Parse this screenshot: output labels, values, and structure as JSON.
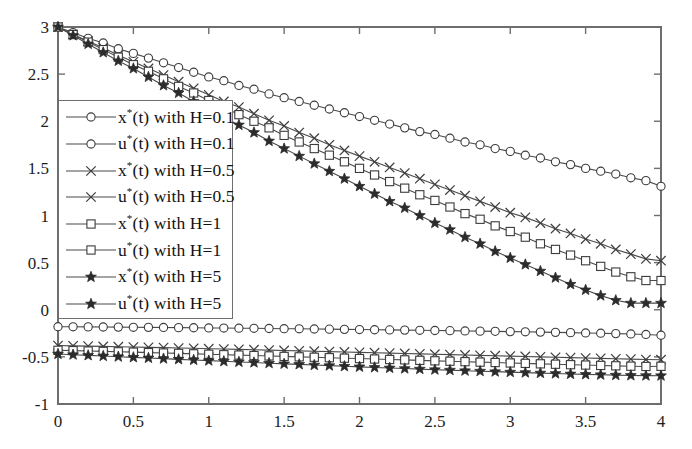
{
  "chart_data": {
    "type": "line",
    "title": "",
    "subtitle": "",
    "xlabel": "",
    "ylabel": "",
    "xlim": [
      0,
      4
    ],
    "ylim": [
      -1,
      3
    ],
    "xticks": [
      0,
      0.5,
      1,
      1.5,
      2,
      2.5,
      3,
      3.5,
      4
    ],
    "xtick_labels": [
      "0",
      "0.5",
      "1",
      "1.5",
      "2",
      "2.5",
      "3",
      "3.5",
      "4"
    ],
    "yticks": [
      -1,
      -0.5,
      0,
      0.5,
      1,
      1.5,
      2,
      2.5,
      3
    ],
    "ytick_labels": [
      "-1",
      "-0.5",
      "0",
      "0.5",
      "1",
      "1.5",
      "2",
      "2.5",
      "3"
    ],
    "grid": false,
    "legend_position": "left-center",
    "box": true,
    "line_color": "#4a4a4a",
    "axis_color": "#6e6e6e",
    "x": [
      0,
      0.1,
      0.2,
      0.3,
      0.4,
      0.5,
      0.6,
      0.7,
      0.8,
      0.9,
      1,
      1.1,
      1.2,
      1.3,
      1.4,
      1.5,
      1.6,
      1.7,
      1.8,
      1.9,
      2,
      2.1,
      2.2,
      2.3,
      2.4,
      2.5,
      2.6,
      2.7,
      2.8,
      2.9,
      3,
      3.1,
      3.2,
      3.3,
      3.4,
      3.5,
      3.6,
      3.7,
      3.8,
      3.9,
      4
    ],
    "series": [
      {
        "name": "x*(t) with H=0.1",
        "symbol": "x",
        "star": true,
        "variable": "x",
        "H": "0.1",
        "marker": "circle",
        "marker_style": "open",
        "values": [
          3.0,
          2.94,
          2.88,
          2.83,
          2.77,
          2.72,
          2.67,
          2.62,
          2.57,
          2.52,
          2.47,
          2.43,
          2.38,
          2.34,
          2.29,
          2.25,
          2.21,
          2.17,
          2.13,
          2.09,
          2.05,
          2.01,
          1.97,
          1.93,
          1.89,
          1.86,
          1.82,
          1.78,
          1.75,
          1.71,
          1.68,
          1.64,
          1.61,
          1.57,
          1.54,
          1.5,
          1.47,
          1.44,
          1.4,
          1.37,
          1.31
        ]
      },
      {
        "name": "u*(t) with H=0.1",
        "symbol": "u",
        "star": true,
        "variable": "u",
        "H": "0.1",
        "marker": "circle",
        "marker_style": "open",
        "values": [
          -0.18,
          -0.181,
          -0.182,
          -0.183,
          -0.184,
          -0.186,
          -0.187,
          -0.188,
          -0.19,
          -0.191,
          -0.193,
          -0.194,
          -0.196,
          -0.197,
          -0.199,
          -0.201,
          -0.202,
          -0.204,
          -0.206,
          -0.208,
          -0.21,
          -0.212,
          -0.214,
          -0.216,
          -0.218,
          -0.22,
          -0.222,
          -0.225,
          -0.227,
          -0.229,
          -0.232,
          -0.234,
          -0.237,
          -0.24,
          -0.243,
          -0.246,
          -0.249,
          -0.253,
          -0.257,
          -0.262,
          -0.27
        ]
      },
      {
        "name": "x*(t) with H=0.5",
        "symbol": "x",
        "star": true,
        "variable": "x",
        "H": "0.5",
        "marker": "cross",
        "marker_style": "cross",
        "values": [
          3.0,
          2.92,
          2.85,
          2.78,
          2.7,
          2.63,
          2.56,
          2.49,
          2.42,
          2.35,
          2.28,
          2.21,
          2.15,
          2.08,
          2.01,
          1.95,
          1.88,
          1.82,
          1.75,
          1.69,
          1.63,
          1.57,
          1.51,
          1.45,
          1.39,
          1.33,
          1.27,
          1.21,
          1.15,
          1.09,
          1.03,
          0.98,
          0.92,
          0.86,
          0.81,
          0.75,
          0.7,
          0.64,
          0.59,
          0.54,
          0.52
        ]
      },
      {
        "name": "u*(t) with H=0.5",
        "symbol": "u",
        "star": true,
        "variable": "u",
        "H": "0.5",
        "marker": "cross",
        "marker_style": "cross",
        "values": [
          -0.38,
          -0.383,
          -0.386,
          -0.389,
          -0.392,
          -0.396,
          -0.399,
          -0.402,
          -0.406,
          -0.409,
          -0.413,
          -0.417,
          -0.42,
          -0.424,
          -0.428,
          -0.432,
          -0.436,
          -0.44,
          -0.444,
          -0.448,
          -0.452,
          -0.456,
          -0.46,
          -0.464,
          -0.468,
          -0.472,
          -0.476,
          -0.48,
          -0.484,
          -0.488,
          -0.492,
          -0.496,
          -0.5,
          -0.504,
          -0.508,
          -0.512,
          -0.516,
          -0.52,
          -0.524,
          -0.528,
          -0.53
        ]
      },
      {
        "name": "x*(t) with H=1",
        "symbol": "x",
        "star": true,
        "variable": "x",
        "H": "1",
        "marker": "square",
        "marker_style": "open",
        "values": [
          3.0,
          2.92,
          2.84,
          2.76,
          2.68,
          2.6,
          2.53,
          2.45,
          2.37,
          2.3,
          2.22,
          2.15,
          2.07,
          2.0,
          1.93,
          1.85,
          1.78,
          1.71,
          1.64,
          1.57,
          1.5,
          1.43,
          1.36,
          1.29,
          1.22,
          1.16,
          1.09,
          1.02,
          0.96,
          0.89,
          0.83,
          0.77,
          0.7,
          0.64,
          0.58,
          0.52,
          0.46,
          0.4,
          0.35,
          0.31,
          0.31
        ]
      },
      {
        "name": "u*(t) with H=1",
        "symbol": "u",
        "star": true,
        "variable": "u",
        "H": "1",
        "marker": "square",
        "marker_style": "open",
        "values": [
          -0.43,
          -0.434,
          -0.438,
          -0.442,
          -0.446,
          -0.45,
          -0.455,
          -0.459,
          -0.463,
          -0.468,
          -0.472,
          -0.477,
          -0.481,
          -0.486,
          -0.49,
          -0.495,
          -0.5,
          -0.504,
          -0.509,
          -0.514,
          -0.518,
          -0.523,
          -0.528,
          -0.532,
          -0.537,
          -0.542,
          -0.546,
          -0.551,
          -0.556,
          -0.56,
          -0.565,
          -0.569,
          -0.574,
          -0.578,
          -0.583,
          -0.587,
          -0.591,
          -0.595,
          -0.599,
          -0.602,
          -0.6
        ]
      },
      {
        "name": "x*(t) with H=5",
        "symbol": "x",
        "star": true,
        "variable": "x",
        "H": "5",
        "marker": "star",
        "marker_style": "filled",
        "values": [
          3.0,
          2.91,
          2.82,
          2.73,
          2.64,
          2.56,
          2.47,
          2.38,
          2.3,
          2.21,
          2.13,
          2.04,
          1.96,
          1.88,
          1.79,
          1.71,
          1.63,
          1.55,
          1.47,
          1.39,
          1.31,
          1.23,
          1.15,
          1.08,
          1.0,
          0.92,
          0.85,
          0.77,
          0.7,
          0.62,
          0.55,
          0.48,
          0.41,
          0.34,
          0.27,
          0.21,
          0.15,
          0.1,
          0.07,
          0.07,
          0.07
        ]
      },
      {
        "name": "u*(t) with H=5",
        "symbol": "u",
        "star": true,
        "variable": "u",
        "H": "5",
        "marker": "star",
        "marker_style": "filled",
        "values": [
          -0.47,
          -0.477,
          -0.484,
          -0.491,
          -0.498,
          -0.505,
          -0.512,
          -0.519,
          -0.526,
          -0.533,
          -0.54,
          -0.547,
          -0.554,
          -0.56,
          -0.567,
          -0.574,
          -0.58,
          -0.587,
          -0.593,
          -0.6,
          -0.606,
          -0.612,
          -0.618,
          -0.624,
          -0.63,
          -0.636,
          -0.641,
          -0.647,
          -0.652,
          -0.657,
          -0.662,
          -0.667,
          -0.672,
          -0.677,
          -0.682,
          -0.686,
          -0.69,
          -0.694,
          -0.697,
          -0.699,
          -0.7
        ]
      }
    ],
    "legend": [
      {
        "variable": "x",
        "H": "0.1",
        "marker": "circle",
        "label": "(t) with H=0.1"
      },
      {
        "variable": "u",
        "H": "0.1",
        "marker": "circle",
        "label": "(t) with H=0.1"
      },
      {
        "variable": "x",
        "H": "0.5",
        "marker": "cross",
        "label": "(t) with H=0.5"
      },
      {
        "variable": "u",
        "H": "0.5",
        "marker": "cross",
        "label": "(t) with H=0.5"
      },
      {
        "variable": "x",
        "H": "1",
        "marker": "square",
        "label": "(t) with H=1"
      },
      {
        "variable": "u",
        "H": "1",
        "marker": "square",
        "label": "(t) with H=1"
      },
      {
        "variable": "x",
        "H": "5",
        "marker": "star",
        "label": "(t) with H=5"
      },
      {
        "variable": "u",
        "H": "5",
        "marker": "star",
        "label": "(t) with H=5"
      }
    ]
  }
}
